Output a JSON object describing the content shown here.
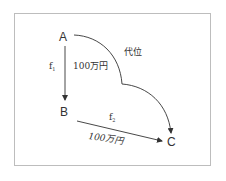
{
  "diagram": {
    "nodes": [
      {
        "id": "A",
        "label": "A"
      },
      {
        "id": "B",
        "label": "B"
      },
      {
        "id": "C",
        "label": "C"
      }
    ],
    "edges": [
      {
        "from": "A",
        "to": "B",
        "name": "f",
        "subscript": "1",
        "amount": "100万円"
      },
      {
        "from": "B",
        "to": "C",
        "name": "f",
        "subscript": "2",
        "amount": "100万円"
      },
      {
        "from": "A",
        "to": "C",
        "label": "代位",
        "style": "curved"
      }
    ],
    "colors": {
      "line": "#333333",
      "frame": "#bdbdbd",
      "background": "#ffffff"
    }
  }
}
